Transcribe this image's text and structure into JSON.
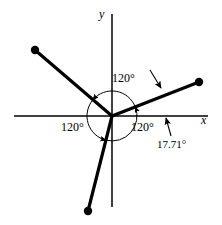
{
  "figure": {
    "type": "vector-phasor-diagram",
    "background_color": "#ffffff",
    "stroke_color": "#000000",
    "axes": {
      "x_label": "x",
      "y_label": "y",
      "origin": {
        "x": 112,
        "y": 116
      },
      "x_axis_from": {
        "x": 14,
        "y": 116
      },
      "x_axis_to": {
        "x": 208,
        "y": 116
      },
      "y_axis_from": {
        "x": 112,
        "y": 14
      },
      "y_axis_to": {
        "x": 112,
        "y": 207
      }
    },
    "arc": {
      "radius": 25,
      "description": "dashed-free thin circle through the three angle arcs"
    },
    "vectors": [
      {
        "name": "vector-upper-right",
        "angle_deg": 21.4,
        "end": {
          "x": 199,
          "y": 82
        },
        "dot": true
      },
      {
        "name": "vector-upper-left",
        "angle_deg": 139.4,
        "end": {
          "x": 35,
          "y": 50
        },
        "dot": true
      },
      {
        "name": "vector-lower",
        "angle_deg": 255.8,
        "end": {
          "x": 88,
          "y": 211
        },
        "dot": true
      }
    ],
    "angle_labels": [
      {
        "name": "angle-label-top",
        "text": "120°",
        "x": 112,
        "y": 73
      },
      {
        "name": "angle-label-left",
        "text": "120°",
        "x": 62,
        "y": 121
      },
      {
        "name": "angle-label-right",
        "text": "120°",
        "x": 131,
        "y": 121
      }
    ],
    "callout": {
      "name": "offset-angle-label",
      "text": "17.71°",
      "x": 158,
      "y": 138,
      "pointer_from": {
        "x": 171,
        "y": 135
      },
      "pointer_to": {
        "x": 166,
        "y": 118
      }
    },
    "leader_arrow": {
      "name": "vector-pointer-arrow",
      "from": {
        "x": 150,
        "y": 70
      },
      "to": {
        "x": 161,
        "y": 89
      }
    }
  }
}
